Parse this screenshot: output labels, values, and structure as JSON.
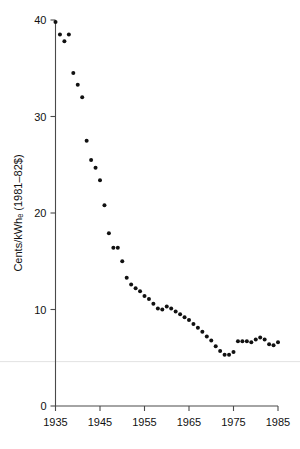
{
  "chart_data": {
    "type": "scatter",
    "title": "",
    "xlabel": "",
    "ylabel": "Cents/kWhₑ (1981–82$)",
    "xlim": [
      1935,
      1985
    ],
    "ylim": [
      0,
      40
    ],
    "xticks": [
      1935,
      1945,
      1955,
      1965,
      1975,
      1985
    ],
    "xticklabels": [
      "1935",
      "1945",
      "1955",
      "1965",
      "1975",
      "1985"
    ],
    "yticks": [
      0,
      10,
      20,
      30,
      40
    ],
    "yticklabels": [
      "0",
      "10",
      "20",
      "30",
      "40"
    ],
    "grid": false,
    "legend": null,
    "marker": "filled-circle",
    "marker_color": "#111111",
    "axis_color": "#4a4a4a",
    "guide_line_y": 4.6,
    "x": [
      1935,
      1936,
      1937,
      1938,
      1939,
      1940,
      1941,
      1942,
      1943,
      1944,
      1945,
      1946,
      1947,
      1948,
      1949,
      1950,
      1951,
      1952,
      1953,
      1954,
      1955,
      1956,
      1957,
      1958,
      1959,
      1960,
      1961,
      1962,
      1963,
      1964,
      1965,
      1966,
      1967,
      1968,
      1969,
      1970,
      1971,
      1972,
      1973,
      1974,
      1975,
      1976,
      1977,
      1978,
      1979,
      1980,
      1981,
      1982,
      1983,
      1984,
      1985
    ],
    "y": [
      39.8,
      38.5,
      37.8,
      38.5,
      34.5,
      33.3,
      32.0,
      27.5,
      25.5,
      24.7,
      23.4,
      20.8,
      17.9,
      16.4,
      16.4,
      15.0,
      13.3,
      12.6,
      12.2,
      11.9,
      11.4,
      11.1,
      10.6,
      10.1,
      10.0,
      10.3,
      10.1,
      9.8,
      9.5,
      9.2,
      8.9,
      8.5,
      8.1,
      7.7,
      7.2,
      6.8,
      6.2,
      5.7,
      5.3,
      5.3,
      5.6,
      6.7,
      6.7,
      6.7,
      6.6,
      6.9,
      7.1,
      6.9,
      6.4,
      6.3,
      6.6
    ]
  }
}
